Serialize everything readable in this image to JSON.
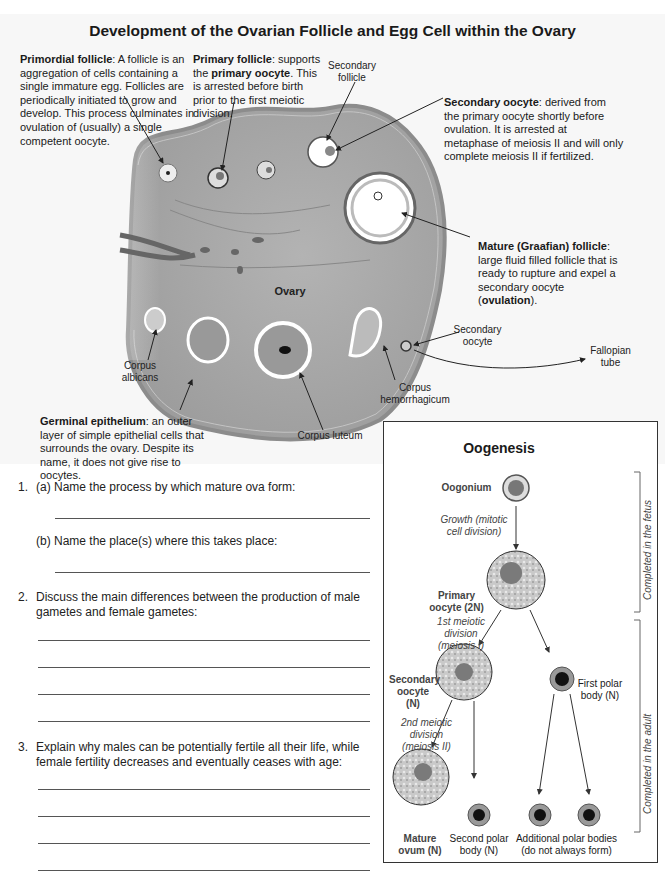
{
  "title": "Development of the Ovarian Follicle and Egg Cell within the Ovary",
  "annotations": {
    "primordial": {
      "term": "Primordial follicle",
      "text": ": A follicle is an aggregation of cells containing a single immature egg. Follicles are periodically initiated to grow and develop. This process culminates in ovulation of (usually) a single competent oocyte."
    },
    "primary": {
      "term": "Primary follicle",
      "text1": ": supports the ",
      "term2": "primary oocyte",
      "text2": ". This is arrested before birth prior to the first meiotic division."
    },
    "secondary_oocyte": {
      "term": "Secondary oocyte",
      "text": ": derived from the primary oocyte shortly before ovulation. It is arrested at metaphase of meiosis II and will only complete meiosis II if fertilized."
    },
    "mature": {
      "term": "Mature (Graafian) follicle",
      "text1": ": large fluid filled follicle that is ready to rupture and expel a secondary oocyte (",
      "term2": "ovulation",
      "text2": ")."
    },
    "germinal": {
      "term": "Germinal epithelium",
      "text": ": an outer layer of simple epithelial cells that surrounds the ovary. Despite its name, it does not give rise to oocytes."
    }
  },
  "labels": {
    "secondary_follicle": "Secondary follicle",
    "ovary": "Ovary",
    "corpus_albicans": "Corpus albicans",
    "corpus_luteum": "Corpus luteum",
    "corpus_hemorrhagicum": "Corpus hemorrhagicum",
    "secondary_oocyte": "Secondary oocyte",
    "fallopian_tube": "Fallopian tube"
  },
  "questions": [
    {
      "num": "1.",
      "text": "(a) Name the process by which mature ova form:"
    },
    {
      "num": "",
      "text": "(b) Name the place(s) where this takes place:"
    },
    {
      "num": "2.",
      "text": "Discuss the main differences between the production of male gametes and female gametes:"
    },
    {
      "num": "3.",
      "text": "Explain why males can be potentially fertile all their life, while female fertility decreases and eventually ceases with age:"
    }
  ],
  "oogenesis": {
    "title": "Oogenesis",
    "oogonium": "Oogonium",
    "growth": "Growth (mitotic cell division)",
    "primary_oocyte": "Primary oocyte (2N)",
    "meiosis1": "1st meiotic division (meiosis I)",
    "secondary_oocyte": "Secondary oocyte (N)",
    "first_polar": "First polar body (N)",
    "meiosis2": "2nd meiotic division (meiosis II)",
    "mature_ovum": "Mature ovum (N)",
    "second_polar": "Second polar body (N)",
    "additional_polar": "Additional polar bodies (do not always form)",
    "fetus_bracket": "Completed in the fetus",
    "adult_bracket": "Completed in the adult"
  },
  "colors": {
    "ovary_fill": "#a9a9a9",
    "ovary_edge": "#8c8c8c",
    "nucleus": "#7a7a7a",
    "polar": "#111111"
  }
}
